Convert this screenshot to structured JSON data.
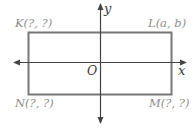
{
  "diagram": {
    "type": "coordinate-plane",
    "axes": {
      "x_label": "x",
      "y_label": "y",
      "origin_label": "O"
    },
    "shape": "rectangle",
    "vertices": [
      {
        "name": "K",
        "label": "K(?, ?)",
        "position": "top-left"
      },
      {
        "name": "L",
        "label": "L(a, b)",
        "position": "top-right"
      },
      {
        "name": "M",
        "label": "M(?, ?)",
        "position": "bottom-right"
      },
      {
        "name": "N",
        "label": "N(?, ?)",
        "position": "bottom-left"
      }
    ],
    "colors": {
      "axis": "#444444",
      "rectangle": "#777777",
      "vertex_label": "#8c8c8c",
      "axis_label": "#3a3a3a"
    }
  }
}
